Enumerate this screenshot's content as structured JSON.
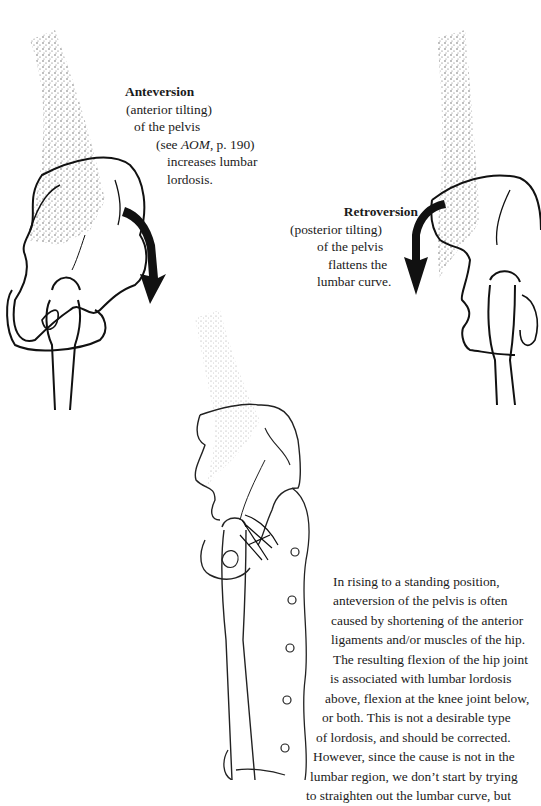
{
  "figures": {
    "anteversion": {
      "title": "Anteversion",
      "lines": [
        "(anterior tilting)",
        "of the pelvis",
        "(see ",
        "AOM",
        ", p. 190)",
        "increases lumbar",
        "lordosis."
      ]
    },
    "retroversion": {
      "title": "Retroversion",
      "lines": [
        "(posterior tilting)",
        "of the pelvis",
        "flattens the",
        "lumbar curve."
      ]
    }
  },
  "body_text": {
    "lines": [
      "In rising to a standing position,",
      "anteversion of the pelvis is often",
      "caused by shortening of the anterior",
      "ligaments and/or muscles of the hip.",
      "The resulting flexion of the hip joint",
      "is associated with lumbar lordosis",
      "above, flexion at the knee joint below,",
      "or both. This is not a desirable type",
      "of lordosis, and should be corrected.",
      "However, since the cause is not in the",
      "lumbar region, we don’t start by trying",
      "to straighten out the lumbar curve, but"
    ]
  }
}
